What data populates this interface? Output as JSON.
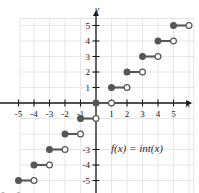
{
  "figure": {
    "title": "",
    "formula_label": "f(x) = int(x)",
    "x_axis_name": "x",
    "y_axis_name": "y"
  },
  "chart_data": {
    "type": "line",
    "title": "f(x) = int(x)",
    "xlabel": "x",
    "ylabel": "y",
    "xlim": [
      -6.3,
      6.2
    ],
    "ylim": [
      -6.5,
      6.0
    ],
    "grid": true,
    "legend": null,
    "x_ticks": [
      -5,
      -4,
      -3,
      -2,
      -1,
      1,
      2,
      3,
      4,
      5
    ],
    "x_tick_labels": [
      "-5",
      "-4",
      "-3",
      "-2",
      "-1",
      "1",
      "2",
      "3",
      "4",
      "5"
    ],
    "y_ticks": [
      5,
      4,
      3,
      2,
      1,
      -3,
      -4,
      -5
    ],
    "y_tick_labels": [
      "5",
      "4",
      "3",
      "2",
      "1",
      "-3",
      "-4",
      "-5"
    ],
    "function": "greatest integer / step function",
    "steps": [
      {
        "x_start": -6,
        "x_end": -5,
        "y": -6,
        "left_closed": true,
        "right_closed": false
      },
      {
        "x_start": -5,
        "x_end": -4,
        "y": -5,
        "left_closed": true,
        "right_closed": false
      },
      {
        "x_start": -4,
        "x_end": -3,
        "y": -4,
        "left_closed": true,
        "right_closed": false
      },
      {
        "x_start": -3,
        "x_end": -2,
        "y": -3,
        "left_closed": true,
        "right_closed": false
      },
      {
        "x_start": -2,
        "x_end": -1,
        "y": -2,
        "left_closed": true,
        "right_closed": false
      },
      {
        "x_start": -1,
        "x_end": 0,
        "y": -1,
        "left_closed": true,
        "right_closed": false
      },
      {
        "x_start": 0,
        "x_end": 1,
        "y": 0,
        "left_closed": true,
        "right_closed": false
      },
      {
        "x_start": 1,
        "x_end": 2,
        "y": 1,
        "left_closed": true,
        "right_closed": false
      },
      {
        "x_start": 2,
        "x_end": 3,
        "y": 2,
        "left_closed": true,
        "right_closed": false
      },
      {
        "x_start": 3,
        "x_end": 4,
        "y": 3,
        "left_closed": true,
        "right_closed": false
      },
      {
        "x_start": 4,
        "x_end": 5,
        "y": 4,
        "left_closed": true,
        "right_closed": false
      },
      {
        "x_start": 5,
        "x_end": 6,
        "y": 5,
        "left_closed": true,
        "right_closed": false
      }
    ],
    "colors": {
      "curve": "#565656",
      "axis": "#1a1a1a",
      "grid": "#e6e6e6",
      "background": "#ffffff"
    }
  }
}
